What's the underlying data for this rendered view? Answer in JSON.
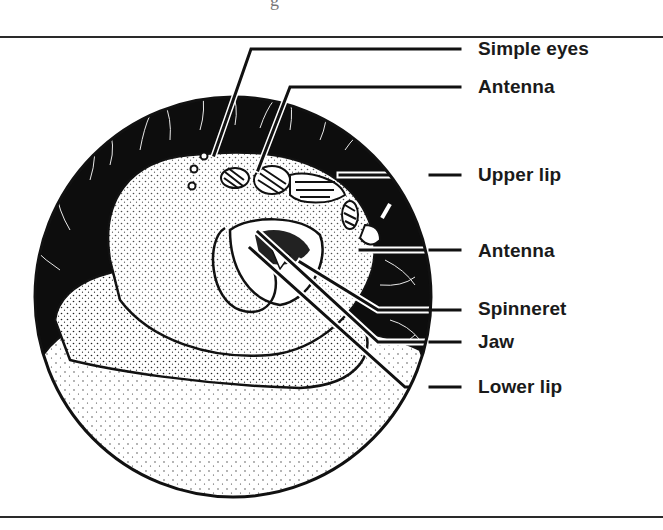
{
  "figure": {
    "top_fragment": "g",
    "labels": [
      {
        "id": "simple-eyes",
        "text": "Simple eyes",
        "y": 10
      },
      {
        "id": "antenna-upper",
        "text": "Antenna",
        "y": 50
      },
      {
        "id": "upper-lip",
        "text": "Upper lip",
        "y": 135
      },
      {
        "id": "antenna-lower",
        "text": "Antenna",
        "y": 209
      },
      {
        "id": "spinneret",
        "text": "Spinneret",
        "y": 266
      },
      {
        "id": "jaw",
        "text": "Jaw",
        "y": 297
      },
      {
        "id": "lower-lip",
        "text": "Lower lip",
        "y": 337
      }
    ],
    "colors": {
      "ink": "#111111",
      "background": "#ffffff",
      "rule": "#2a2a2a"
    }
  }
}
